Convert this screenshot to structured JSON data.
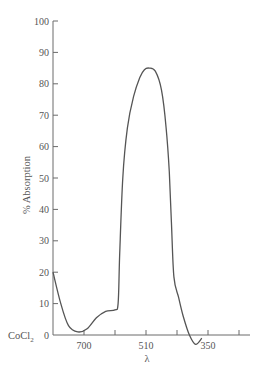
{
  "chart_data": {
    "type": "line",
    "title": "",
    "xlabel": "λ",
    "ylabel": "% Absorption",
    "series_label": "CoCl₂",
    "series_label_text": "CoCl",
    "series_label_sub": "2",
    "ylim": [
      0,
      100
    ],
    "yticks": [
      0,
      10,
      20,
      30,
      40,
      50,
      60,
      70,
      80,
      90,
      100
    ],
    "xtick_positions": [
      1,
      2,
      3,
      4,
      5,
      6
    ],
    "xtick_labels": [
      {
        "pos": 1,
        "label": "700"
      },
      {
        "pos": 3,
        "label": "510"
      },
      {
        "pos": 5,
        "label": "350"
      }
    ],
    "xlim": [
      0,
      6.3
    ],
    "grid": false,
    "legend": "none",
    "series": [
      {
        "name": "CoCl2",
        "x": [
          0.0,
          0.25,
          0.5,
          0.8,
          1.1,
          1.4,
          1.7,
          2.0,
          2.1,
          2.15,
          2.25,
          2.4,
          2.6,
          2.8,
          2.95,
          3.1,
          3.3,
          3.5,
          3.65,
          3.75,
          3.82,
          3.9,
          4.05,
          4.2,
          4.4,
          4.6,
          4.8
        ],
        "y": [
          20,
          10,
          3,
          1,
          2,
          5.5,
          7.5,
          8,
          10,
          25,
          50,
          66,
          76,
          82,
          84.5,
          85,
          84,
          78,
          66,
          52,
          36,
          18.5,
          12,
          6,
          0,
          -3,
          -1
        ]
      }
    ]
  }
}
